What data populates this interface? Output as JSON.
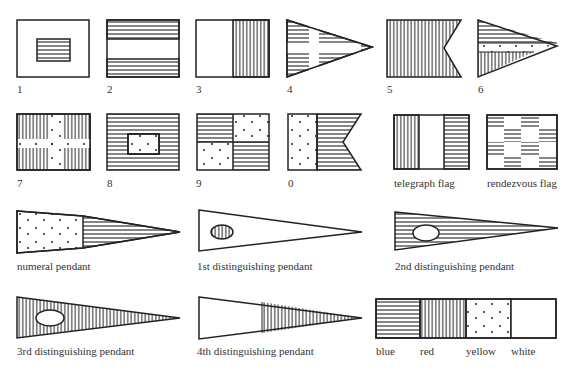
{
  "flags": [
    {
      "id": "1",
      "label": "1"
    },
    {
      "id": "2",
      "label": "2"
    },
    {
      "id": "3",
      "label": "3"
    },
    {
      "id": "4",
      "label": "4"
    },
    {
      "id": "5",
      "label": "5"
    },
    {
      "id": "6",
      "label": "6"
    },
    {
      "id": "7",
      "label": "7"
    },
    {
      "id": "8",
      "label": "8"
    },
    {
      "id": "9",
      "label": "9"
    },
    {
      "id": "0",
      "label": "0"
    },
    {
      "id": "telegraph",
      "label": "telegraph flag"
    },
    {
      "id": "rendezvous",
      "label": "rendezvous flag"
    }
  ],
  "pendants": [
    {
      "id": "numeral",
      "label": "numeral pendant"
    },
    {
      "id": "first",
      "label": "1st distinguishing pendant"
    },
    {
      "id": "second",
      "label": "2nd distinguishing pendant"
    },
    {
      "id": "third",
      "label": "3rd distinguishing pendant"
    },
    {
      "id": "fourth",
      "label": "4th distinguishing pendant"
    }
  ],
  "legend": {
    "items": [
      {
        "pattern": "horizontal-lines",
        "label": "blue"
      },
      {
        "pattern": "vertical-lines",
        "label": "red"
      },
      {
        "pattern": "dots",
        "label": "yellow"
      },
      {
        "pattern": "plain",
        "label": "white"
      }
    ]
  }
}
